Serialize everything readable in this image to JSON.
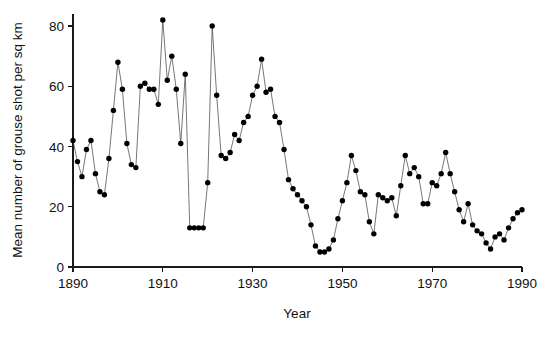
{
  "chart_data": {
    "type": "line",
    "title": "",
    "subtitle": "",
    "xlabel": "Year",
    "ylabel": "Mean number of grouse shot per sq km",
    "xlim": [
      1890,
      1990
    ],
    "ylim": [
      0,
      84
    ],
    "grid": false,
    "legend": null,
    "marker": "filled-circle",
    "xticks": [
      1890,
      1910,
      1930,
      1950,
      1970,
      1990
    ],
    "xtick_labels": [
      "1890",
      "1910",
      "1930",
      "1950",
      "1970",
      "1990"
    ],
    "yticks": [
      0,
      20,
      40,
      60,
      80
    ],
    "ytick_labels": [
      "0",
      "20",
      "40",
      "60",
      "80"
    ],
    "series": [
      {
        "name": "Mean number of grouse shot per sq km",
        "x": [
          1890,
          1891,
          1892,
          1893,
          1894,
          1895,
          1896,
          1897,
          1898,
          1899,
          1900,
          1901,
          1902,
          1903,
          1904,
          1905,
          1906,
          1907,
          1908,
          1909,
          1910,
          1911,
          1912,
          1913,
          1914,
          1915,
          1916,
          1917,
          1918,
          1919,
          1920,
          1921,
          1922,
          1923,
          1924,
          1925,
          1926,
          1927,
          1928,
          1929,
          1930,
          1931,
          1932,
          1933,
          1934,
          1935,
          1936,
          1937,
          1938,
          1939,
          1940,
          1941,
          1942,
          1943,
          1944,
          1945,
          1946,
          1947,
          1948,
          1949,
          1950,
          1951,
          1952,
          1953,
          1954,
          1955,
          1956,
          1957,
          1958,
          1959,
          1960,
          1961,
          1962,
          1963,
          1964,
          1965,
          1966,
          1967,
          1968,
          1969,
          1970,
          1971,
          1972,
          1973,
          1974,
          1975,
          1976,
          1977,
          1978,
          1979,
          1980,
          1981,
          1982,
          1983,
          1984,
          1985,
          1986,
          1987,
          1988,
          1989,
          1990
        ],
        "values": [
          42,
          35,
          30,
          39,
          42,
          31,
          25,
          24,
          36,
          52,
          68,
          59,
          41,
          34,
          33,
          60,
          61,
          59,
          59,
          54,
          82,
          62,
          70,
          59,
          41,
          64,
          13,
          13,
          13,
          13,
          28,
          80,
          57,
          37,
          36,
          38,
          44,
          42,
          48,
          50,
          57,
          60,
          69,
          58,
          59,
          50,
          48,
          39,
          29,
          26,
          24,
          22,
          20,
          14,
          7,
          5,
          5,
          6,
          9,
          16,
          22,
          28,
          37,
          32,
          25,
          24,
          15,
          11,
          24,
          23,
          22,
          23,
          17,
          27,
          37,
          31,
          33,
          30,
          21,
          21,
          28,
          27,
          31,
          38,
          31,
          25,
          19,
          15,
          21,
          14,
          12,
          11,
          8,
          6,
          10,
          11,
          9,
          13,
          16,
          18,
          19
        ]
      }
    ]
  },
  "labels": {
    "x_axis_title": "Year",
    "y_axis_title": "Mean number of grouse shot per sq km"
  }
}
